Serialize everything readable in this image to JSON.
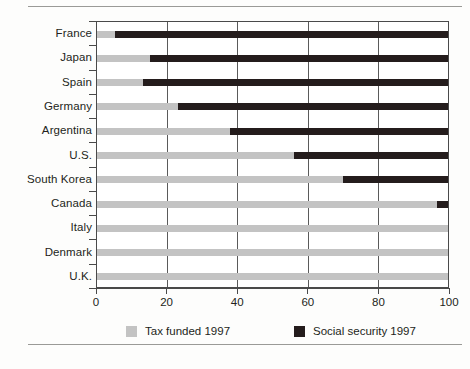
{
  "chart_data": {
    "type": "bar",
    "orientation": "horizontal",
    "stacked": true,
    "title": "",
    "subtitle": "",
    "xlabel": "",
    "ylabel": "",
    "xlim": [
      0,
      100
    ],
    "xticks": [
      0,
      20,
      40,
      60,
      80,
      100
    ],
    "xtick_labels": [
      "0",
      "20",
      "40",
      "60",
      "80",
      "100"
    ],
    "grid": "vertical",
    "legend_position": "bottom",
    "categories": [
      "France",
      "Japan",
      "Spain",
      "Germany",
      "Argentina",
      "U.S.",
      "South Korea",
      "Canada",
      "Italy",
      "Denmark",
      "U.K."
    ],
    "series": [
      {
        "name": "Tax funded 1997",
        "color": "#c3c3c3",
        "values": [
          5,
          15,
          13,
          23,
          38,
          56,
          70,
          97,
          100,
          100,
          100
        ]
      },
      {
        "name": "Social security 1997",
        "color": "#241c1c",
        "values": [
          95,
          85,
          87,
          77,
          62,
          44,
          30,
          3,
          0,
          0,
          0
        ]
      }
    ]
  },
  "legend": {
    "items": [
      {
        "label": "Tax funded 1997",
        "swatch": "tax"
      },
      {
        "label": "Social security 1997",
        "swatch": "social"
      }
    ]
  }
}
